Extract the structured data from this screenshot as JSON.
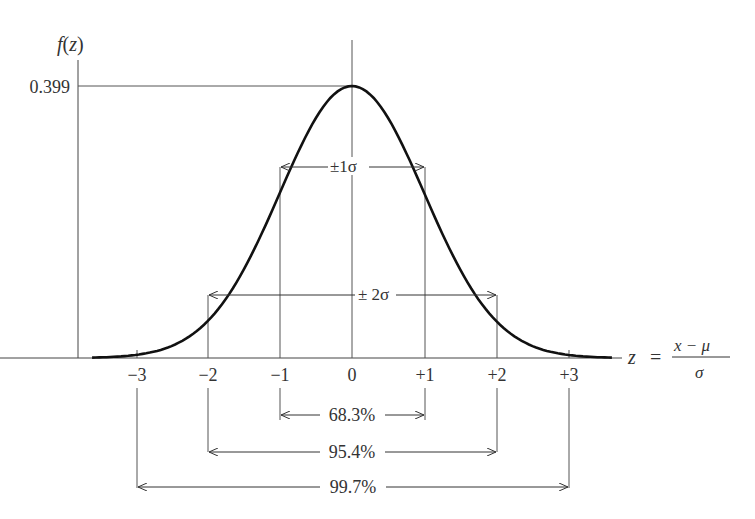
{
  "chart_data": {
    "type": "line",
    "title": "",
    "xlabel": "z = (x − μ) / σ",
    "ylabel": "f(z)",
    "ylabel_parts": {
      "f": "f",
      "open": "(",
      "z": "z",
      "close": ")"
    },
    "xlabel_parts": {
      "z": "z",
      "eq": "=",
      "num": "x −  μ",
      "den": "σ"
    },
    "y_ticks": [
      "0.399"
    ],
    "peak_value": 0.399,
    "x_ticks": [
      "−3",
      "−2",
      "−1",
      "0",
      "+1",
      "+2",
      "+3"
    ],
    "x_tick_values": [
      -3,
      -2,
      -1,
      0,
      1,
      2,
      3
    ],
    "xlim": [
      -3.6,
      3.6
    ],
    "ylim": [
      0,
      0.399
    ],
    "series": [
      {
        "name": "Standard normal density",
        "x": [
          -3.6,
          -3,
          -2,
          -1,
          0,
          1,
          2,
          3,
          3.6
        ],
        "values": [
          0.0006,
          0.0044,
          0.054,
          0.242,
          0.399,
          0.242,
          0.054,
          0.0044,
          0.0006
        ]
      }
    ],
    "annotations": [
      {
        "text": "±1σ",
        "from": -1,
        "to": 1,
        "position": "on curve at f(±1)"
      },
      {
        "text": "±2σ",
        "from": -2,
        "to": 2,
        "position": "on curve at f(±2)"
      },
      {
        "text": "68.3%",
        "from": -1,
        "to": 1,
        "position": "below axis"
      },
      {
        "text": "95.4%",
        "from": -2,
        "to": 2,
        "position": "below axis"
      },
      {
        "text": "99.7%",
        "from": -3,
        "to": 3,
        "position": "below axis"
      }
    ],
    "grid": false,
    "legend": "none"
  },
  "labels": {
    "pm1": "±1σ",
    "pm2": "± 2σ",
    "pct1": "68.3%",
    "pct2": "95.4%",
    "pct3": "99.7%"
  }
}
